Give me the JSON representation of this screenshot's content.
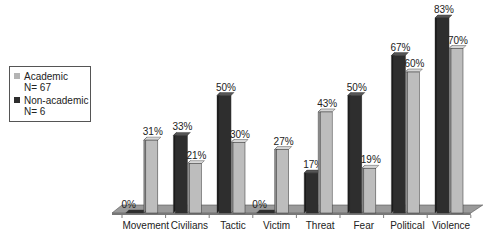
{
  "chart_data": {
    "type": "bar",
    "title": "",
    "xlabel": "",
    "ylabel": "",
    "ylim": [
      0,
      100
    ],
    "grid": false,
    "legend_position": "left",
    "style": "3d-clustered-column",
    "categories": [
      "Movement",
      "Civilians",
      "Tactic",
      "Victim",
      "Threat",
      "Fear",
      "Political",
      "Violence"
    ],
    "series": [
      {
        "name": "Academic",
        "sublabel": "N= 67",
        "color": "#b4b4b4",
        "values": [
          31,
          21,
          30,
          27,
          43,
          19,
          60,
          70
        ]
      },
      {
        "name": "Non-academic",
        "sublabel": "N= 6",
        "color": "#2e2e2e",
        "values": [
          0,
          33,
          50,
          0,
          17,
          50,
          67,
          83
        ]
      }
    ],
    "value_labels_suffix": "%"
  },
  "legend": {
    "items": [
      {
        "label": "Academic",
        "sublabel": "N= 67",
        "color": "#b4b4b4"
      },
      {
        "label": "Non-academic",
        "sublabel": "N= 6",
        "color": "#2e2e2e"
      }
    ]
  }
}
